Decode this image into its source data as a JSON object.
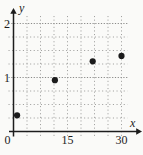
{
  "figure": {
    "background": "#fafaf8",
    "axis_color": "#1c1c1c",
    "grid_minor_color": "#a2a2a0",
    "grid_major_color": "#8a8a88",
    "point_color": "#1b1b1b",
    "xlabel": "x",
    "ylabel": "y",
    "x_ticks": [
      {
        "value": 0,
        "label": "0"
      },
      {
        "value": 15,
        "label": "15"
      },
      {
        "value": 30,
        "label": "30"
      }
    ],
    "y_ticks": [
      {
        "value": 1,
        "label": "1"
      },
      {
        "value": 2,
        "label": "2"
      }
    ]
  },
  "chart_data": {
    "type": "scatter",
    "title": "",
    "xlabel": "x",
    "ylabel": "y",
    "xlim": [
      0,
      30
    ],
    "ylim": [
      0,
      2
    ],
    "x_tick_values": [
      0,
      15,
      30
    ],
    "y_tick_values": [
      1,
      2
    ],
    "x_minor_step": 3.75,
    "y_minor_step": 0.25,
    "grid": "dotted",
    "legend": "none",
    "marker": "filled-circle",
    "points": [
      [
        1,
        0.3
      ],
      [
        11.5,
        0.95
      ],
      [
        22,
        1.3
      ],
      [
        30,
        1.4
      ]
    ]
  }
}
